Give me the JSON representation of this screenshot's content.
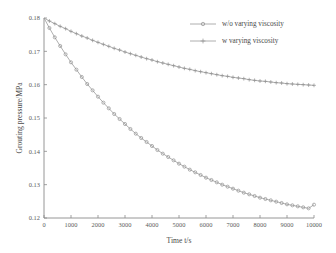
{
  "chart_data": {
    "type": "line",
    "title": "",
    "xlabel": "Time t/s",
    "ylabel": "Grouting pressure/MPa",
    "xlim": [
      0,
      10000
    ],
    "ylim": [
      0.12,
      0.18
    ],
    "xticks": [
      0,
      1000,
      2000,
      3000,
      4000,
      5000,
      6000,
      7000,
      8000,
      9000,
      10000
    ],
    "xtick_labels": [
      "0",
      "1000",
      "2000",
      "3000",
      "4000",
      "5000",
      "6000",
      "7000",
      "8000",
      "9000",
      "10000"
    ],
    "yticks": [
      0.12,
      0.13,
      0.14,
      0.15,
      0.16,
      0.17,
      0.18
    ],
    "ytick_labels": [
      "0.12",
      "0.13",
      "0.14",
      "0.15",
      "0.16",
      "0.17",
      "0.18"
    ],
    "grid": false,
    "legend_position": "top-right",
    "line_color": "#9a9a9a",
    "axis_color": "#8a8a8a",
    "background": "#ffffff",
    "x": [
      0,
      200,
      400,
      600,
      800,
      1000,
      1200,
      1400,
      1600,
      1800,
      2000,
      2200,
      2400,
      2600,
      2800,
      3000,
      3200,
      3400,
      3600,
      3800,
      4000,
      4200,
      4400,
      4600,
      4800,
      5000,
      5200,
      5400,
      5600,
      5800,
      6000,
      6200,
      6400,
      6600,
      6800,
      7000,
      7200,
      7400,
      7600,
      7800,
      8000,
      8200,
      8400,
      8600,
      8800,
      9000,
      9200,
      9400,
      9600,
      9800,
      10000
    ],
    "series": [
      {
        "name": "w/o varying viscosity",
        "marker": "circle",
        "values": [
          0.18,
          0.177,
          0.1742,
          0.1716,
          0.1691,
          0.1667,
          0.1645,
          0.1623,
          0.1602,
          0.1583,
          0.1564,
          0.1546,
          0.1529,
          0.1512,
          0.1497,
          0.1482,
          0.1467,
          0.1453,
          0.144,
          0.1428,
          0.1416,
          0.1404,
          0.1393,
          0.1383,
          0.1373,
          0.1363,
          0.1354,
          0.1345,
          0.1337,
          0.1329,
          0.1321,
          0.1314,
          0.1307,
          0.13,
          0.1294,
          0.1288,
          0.1282,
          0.1276,
          0.1271,
          0.1266,
          0.1261,
          0.1257,
          0.1253,
          0.1249,
          0.1245,
          0.1241,
          0.1238,
          0.1235,
          0.1232,
          0.1229,
          0.124
        ]
      },
      {
        "name": "w varying viscosity",
        "marker": "plus",
        "values": [
          0.18,
          0.1791,
          0.1783,
          0.1775,
          0.1768,
          0.176,
          0.1753,
          0.1746,
          0.174,
          0.1733,
          0.1727,
          0.1721,
          0.1715,
          0.1709,
          0.1704,
          0.1698,
          0.1693,
          0.1688,
          0.1683,
          0.1678,
          0.1674,
          0.1669,
          0.1665,
          0.1661,
          0.1657,
          0.1653,
          0.1649,
          0.1646,
          0.1642,
          0.1639,
          0.1636,
          0.1633,
          0.163,
          0.1627,
          0.1625,
          0.1622,
          0.162,
          0.1618,
          0.1615,
          0.1613,
          0.1611,
          0.161,
          0.1608,
          0.1606,
          0.1605,
          0.1603,
          0.1602,
          0.1601,
          0.16,
          0.1599,
          0.1598
        ]
      }
    ]
  },
  "legend": {
    "entries": [
      {
        "label": "w/o varying viscosity"
      },
      {
        "label": "w varying viscosity"
      }
    ]
  }
}
